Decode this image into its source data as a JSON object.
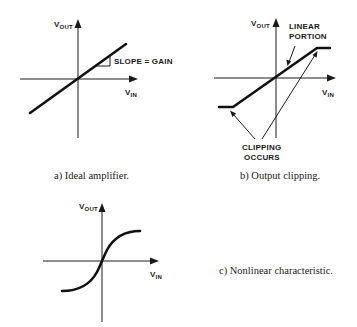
{
  "figure": {
    "panels": [
      {
        "id": "a",
        "caption": "a)  Ideal amplifier.",
        "y_axis_label": "V",
        "y_axis_sub": "OUT",
        "x_axis_label": "V",
        "x_axis_sub": "IN",
        "annotation": "SLOPE = GAIN",
        "curve_type": "linear"
      },
      {
        "id": "b",
        "caption": "b)  Output clipping.",
        "y_axis_label": "V",
        "y_axis_sub": "OUT",
        "x_axis_label": "V",
        "x_axis_sub": "IN",
        "annotation_top_line1": "LINEAR",
        "annotation_top_line2": "PORTION",
        "annotation_bottom_line1": "CLIPPING",
        "annotation_bottom_line2": "OCCURS",
        "curve_type": "clipped-linear"
      },
      {
        "id": "c",
        "caption": "c)  Nonlinear characteristic.",
        "y_axis_label": "V",
        "y_axis_sub": "OUT",
        "x_axis_label": "V",
        "x_axis_sub": "IN",
        "curve_type": "sigmoid"
      }
    ],
    "colors": {
      "background": "#ffffff",
      "ink": "#1a1a1a"
    }
  }
}
